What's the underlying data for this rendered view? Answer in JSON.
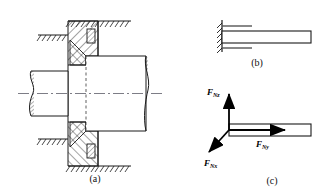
{
  "figure": {
    "background_color": "#ffffff",
    "line_color": "#1a1a1a",
    "subfigures": [
      {
        "id": "a",
        "caption": "(a)",
        "description": "Sectioned journal/thrust bearing mounted in a wall with shaft passing through",
        "parts": [
          "ground-hatching-upper",
          "ground-hatching-lower",
          "bearing-housing",
          "bearing-inner-race",
          "rolling-element",
          "shaft",
          "shaft-break-left",
          "shaft-break-right",
          "center-line"
        ]
      },
      {
        "id": "b",
        "caption": "(b)",
        "description": "Schematic of fixed (built-in) support holding a bar",
        "parts": [
          "fixed-support-wall",
          "support-hatching",
          "bar",
          "upper-tick",
          "lower-tick"
        ]
      },
      {
        "id": "c",
        "caption": "(c)",
        "description": "Free body diagram showing three orthogonal reaction force components at the fixed support",
        "parts": [
          "bar",
          "force-arrow-vertical",
          "force-arrow-horizontal",
          "force-arrow-diagonal"
        ]
      }
    ],
    "force_labels": [
      {
        "id": "f-nz",
        "symbol": "F",
        "subscript": "Nz",
        "direction": "up",
        "arrow": "vertical-up"
      },
      {
        "id": "f-ny",
        "symbol": "F",
        "subscript": "Ny",
        "direction": "right",
        "arrow": "horizontal-right"
      },
      {
        "id": "f-nx",
        "symbol": "F",
        "subscript": "Nx",
        "direction": "down-left",
        "arrow": "diagonal-down-left"
      }
    ]
  }
}
